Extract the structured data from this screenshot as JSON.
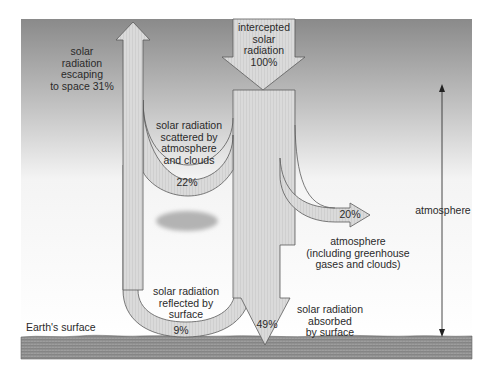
{
  "diagram": {
    "labels": {
      "intercepted": "intercepted\nsolar\nradiation\n100%",
      "escaping": "solar\nradiation\nescaping\nto space 31%",
      "scattered": "solar radiation\nscattered by\natmosphere\nand clouds",
      "scattered_pct": "22%",
      "atmosphere_absorbed_pct": "20%",
      "atmosphere_desc": "atmosphere\n(including greenhouse\ngases and clouds)",
      "reflected": "solar radiation\nreflected by\nsurface",
      "reflected_pct": "9%",
      "surface_absorbed_pct": "49%",
      "surface_absorbed": "solar radiation\nabsorbed\nby surface",
      "earth_surface": "Earth's surface",
      "atmosphere_extent": "atmosphere"
    },
    "flows": [
      {
        "name": "intercepted solar radiation",
        "percent": 100
      },
      {
        "name": "escaping to space",
        "percent": 31
      },
      {
        "name": "scattered by atmosphere and clouds",
        "percent": 22
      },
      {
        "name": "reflected by surface",
        "percent": 9
      },
      {
        "name": "absorbed by atmosphere",
        "percent": 20
      },
      {
        "name": "absorbed by surface",
        "percent": 49
      }
    ],
    "colors": {
      "sky_top": "#8c8c8c",
      "sky_bottom": "#ffffff",
      "arrow_fill": "#d9d9d9",
      "arrow_stroke": "#5a5a5a",
      "ground": "#8f8f8f",
      "cloud": "#b5b5b5"
    }
  }
}
